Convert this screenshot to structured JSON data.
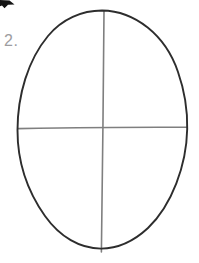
{
  "page": {
    "background": "#ffffff"
  },
  "step": {
    "label": "2.",
    "color": "#9d9da0"
  },
  "sketch": {
    "description": "hand-drawn oval head outline with vertical and horizontal construction guide lines",
    "outline_color": "#2d2d2d",
    "guide_color": "#7f7f7f"
  },
  "corner_fragment": {
    "color": "#141414"
  }
}
